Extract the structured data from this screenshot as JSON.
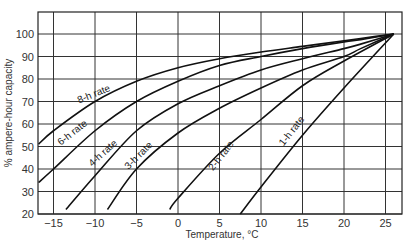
{
  "chart_data": {
    "type": "line",
    "title": "",
    "xlabel": "Temperature, °C",
    "ylabel": "% ampere-hour capacity",
    "xlim": [
      -16.8,
      27
    ],
    "ylim": [
      20,
      110
    ],
    "grid": true,
    "legend": "none (inline curve labels)",
    "x_ticks": [
      -15,
      -10,
      -5,
      0,
      5,
      10,
      15,
      20,
      25
    ],
    "y_ticks": [
      20,
      30,
      40,
      50,
      60,
      70,
      80,
      90,
      100
    ],
    "series": [
      {
        "name": "8-h rate",
        "x": [
          -16.8,
          -15,
          -10,
          -5,
          0,
          5,
          10,
          15,
          20,
          22,
          26
        ],
        "y": [
          51,
          57,
          70,
          79,
          85,
          89,
          92,
          94.5,
          97,
          98,
          100
        ]
      },
      {
        "name": "6-h rate",
        "x": [
          -16.8,
          -15,
          -10,
          -5,
          0,
          5,
          10,
          15,
          20,
          22,
          26
        ],
        "y": [
          34,
          40,
          57,
          70,
          79,
          86,
          90,
          93.5,
          96.5,
          97.5,
          100
        ]
      },
      {
        "name": "4-h rate",
        "x": [
          -13.5,
          -10,
          -5,
          0,
          5,
          10,
          15,
          20,
          22,
          26
        ],
        "y": [
          22,
          37,
          57,
          69,
          77,
          84,
          89,
          93.5,
          95.5,
          100
        ]
      },
      {
        "name": "3-h rate",
        "x": [
          -8.5,
          -5,
          0,
          5,
          10,
          15,
          20,
          22,
          26
        ],
        "y": [
          22,
          40,
          56,
          67,
          76,
          84,
          90,
          93.5,
          100
        ]
      },
      {
        "name": "2-h rate",
        "x": [
          -1,
          0,
          5,
          10,
          15,
          20,
          26
        ],
        "y": [
          22,
          27,
          47,
          62,
          77,
          88,
          100
        ]
      },
      {
        "name": "1-h rate",
        "x": [
          7.5,
          10,
          15,
          20,
          26
        ],
        "y": [
          20,
          32,
          55,
          76,
          100
        ]
      }
    ],
    "annotations": [
      {
        "text": "8-h rate",
        "x": -10,
        "y": 72
      },
      {
        "text": "6-h rate",
        "x": -12.5,
        "y": 55
      },
      {
        "text": "4-h rate",
        "x": -8.8,
        "y": 46
      },
      {
        "text": "3-h rate",
        "x": -4.5,
        "y": 45
      },
      {
        "text": "2-h rate",
        "x": 5.5,
        "y": 45
      },
      {
        "text": "1-h rate",
        "x": 14,
        "y": 56
      }
    ]
  },
  "labels": {
    "xlabel": "Temperature, °C",
    "ylabel": "% ampere-hour capacity",
    "x_ticks": [
      "−15",
      "−10",
      "−5",
      "0",
      "5",
      "10",
      "15",
      "20",
      "25"
    ],
    "y_ticks": [
      "20",
      "30",
      "40",
      "50",
      "60",
      "70",
      "80",
      "90",
      "100"
    ],
    "curves": [
      "8-h rate",
      "6-h rate",
      "4-h rate",
      "3-h rate",
      "2-h rate",
      "1-h rate"
    ]
  }
}
